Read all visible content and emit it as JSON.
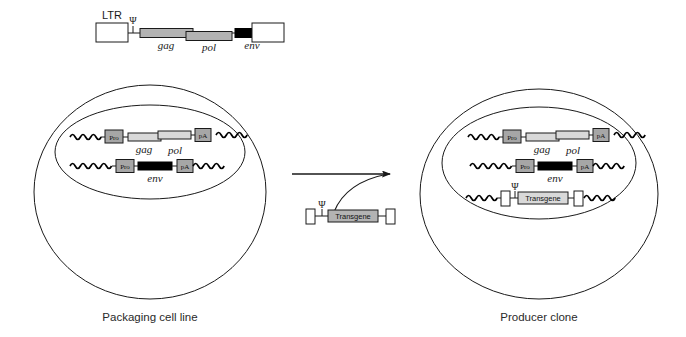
{
  "figure": {
    "colors": {
      "stroke": "#1a1a1a",
      "background": "#ffffff",
      "box_gray": "#a6a6a6",
      "bar_gray": "#b3b3b3",
      "bar_light": "#d9d9d9",
      "black_fill": "#000000",
      "white_fill": "#ffffff",
      "label_text": "#2a2a2a"
    }
  },
  "provirus": {
    "ltr_label": "LTR",
    "psi_symbol": "Ψ",
    "genes": [
      {
        "name": "gag",
        "fill": "bar_gray"
      },
      {
        "name": "pol",
        "fill": "bar_gray"
      },
      {
        "name": "env",
        "fill": "black_fill"
      }
    ]
  },
  "packaging_cell": {
    "label": "Packaging cell line",
    "constructs": [
      {
        "id": "gag-pol-construct",
        "promoter": "Pro",
        "genes": [
          "gag",
          "pol"
        ],
        "terminator": "pA"
      },
      {
        "id": "env-construct",
        "promoter": "Pro",
        "genes": [
          "env"
        ],
        "terminator": "pA"
      }
    ]
  },
  "transgene_vector": {
    "id": "transgene-plasmid",
    "psi_symbol": "Ψ",
    "label": "Transgene",
    "ltr_left": "",
    "ltr_right": ""
  },
  "producer_cell": {
    "label": "Producer clone",
    "constructs": [
      {
        "id": "gag-pol-construct",
        "promoter": "Pro",
        "genes": [
          "gag",
          "pol"
        ],
        "terminator": "pA"
      },
      {
        "id": "env-construct",
        "promoter": "Pro",
        "genes": [
          "env"
        ],
        "terminator": "pA"
      },
      {
        "id": "transgene-construct",
        "psi_symbol": "Ψ",
        "label": "Transgene"
      }
    ]
  },
  "arrow": {
    "direction": "right",
    "label": ""
  }
}
